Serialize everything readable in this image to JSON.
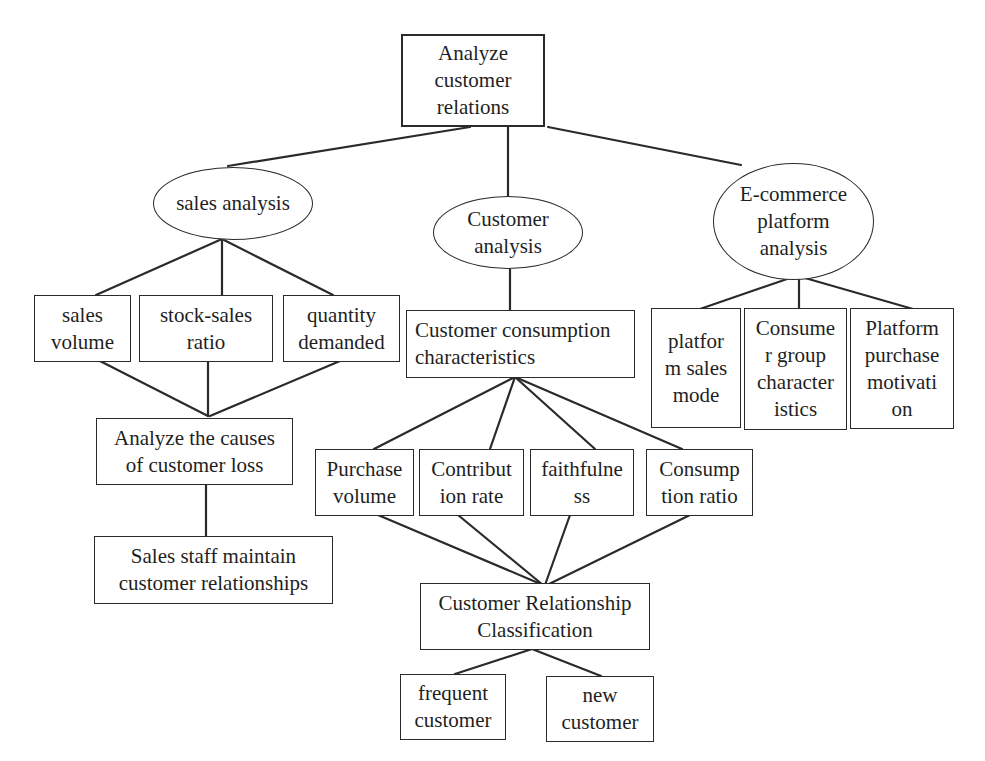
{
  "diagram": {
    "title": "Analyze customer relations",
    "nodes": {
      "root": {
        "label": "Analyze customer\nrelations",
        "shape": "rectangle"
      },
      "sales_analysis": {
        "label": "sales analysis",
        "shape": "ellipse"
      },
      "customer_analysis": {
        "label": "Customer\nanalysis",
        "shape": "ellipse"
      },
      "ecommerce_analysis": {
        "label": "E-commerce\nplatform\nanalysis",
        "shape": "ellipse"
      },
      "sales_volume": {
        "label": "sales\nvolume",
        "shape": "rectangle"
      },
      "stock_sales_ratio": {
        "label": "stock-sales\nratio",
        "shape": "rectangle"
      },
      "quantity_demanded": {
        "label": "quantity\ndemanded",
        "shape": "rectangle"
      },
      "consumption_characteristics": {
        "label": "Customer consumption\ncharacteristics",
        "shape": "rectangle"
      },
      "platform_sales_mode": {
        "label": "platfor\nm sales\nmode",
        "shape": "rectangle"
      },
      "consumer_group_characteristics": {
        "label": "Consume\nr group\ncharacter\nistics",
        "shape": "rectangle"
      },
      "platform_purchase_motivation": {
        "label": "Platform\npurchase\nmotivati\non",
        "shape": "rectangle"
      },
      "causes_customer_loss": {
        "label": "Analyze the causes\nof customer loss",
        "shape": "rectangle"
      },
      "sales_staff_maintain": {
        "label": "Sales staff maintain\ncustomer relationships",
        "shape": "rectangle"
      },
      "purchase_volume": {
        "label": "Purchase\nvolume",
        "shape": "rectangle"
      },
      "contribution_rate": {
        "label": "Contribut\nion rate",
        "shape": "rectangle"
      },
      "faithfulness": {
        "label": "faithfulne\nss",
        "shape": "rectangle"
      },
      "consumption_ratio": {
        "label": "Consump\ntion ratio",
        "shape": "rectangle"
      },
      "relationship_classification": {
        "label": "Customer Relationship\nClassification",
        "shape": "rectangle"
      },
      "frequent_customer": {
        "label": "frequent\ncustomer",
        "shape": "rectangle"
      },
      "new_customer": {
        "label": "new\ncustomer",
        "shape": "rectangle"
      }
    },
    "edges": [
      [
        "root",
        "sales_analysis"
      ],
      [
        "root",
        "customer_analysis"
      ],
      [
        "root",
        "ecommerce_analysis"
      ],
      [
        "sales_analysis",
        "sales_volume"
      ],
      [
        "sales_analysis",
        "stock_sales_ratio"
      ],
      [
        "sales_analysis",
        "quantity_demanded"
      ],
      [
        "sales_volume",
        "causes_customer_loss"
      ],
      [
        "stock_sales_ratio",
        "causes_customer_loss"
      ],
      [
        "quantity_demanded",
        "causes_customer_loss"
      ],
      [
        "causes_customer_loss",
        "sales_staff_maintain"
      ],
      [
        "customer_analysis",
        "consumption_characteristics"
      ],
      [
        "consumption_characteristics",
        "purchase_volume"
      ],
      [
        "consumption_characteristics",
        "contribution_rate"
      ],
      [
        "consumption_characteristics",
        "faithfulness"
      ],
      [
        "consumption_characteristics",
        "consumption_ratio"
      ],
      [
        "purchase_volume",
        "relationship_classification"
      ],
      [
        "contribution_rate",
        "relationship_classification"
      ],
      [
        "faithfulness",
        "relationship_classification"
      ],
      [
        "consumption_ratio",
        "relationship_classification"
      ],
      [
        "relationship_classification",
        "frequent_customer"
      ],
      [
        "relationship_classification",
        "new_customer"
      ],
      [
        "ecommerce_analysis",
        "platform_sales_mode"
      ],
      [
        "ecommerce_analysis",
        "consumer_group_characteristics"
      ],
      [
        "ecommerce_analysis",
        "platform_purchase_motivation"
      ]
    ]
  },
  "colors": {
    "stroke": "#2a2a2a",
    "text": "#1f1f1f",
    "background": "#ffffff"
  }
}
